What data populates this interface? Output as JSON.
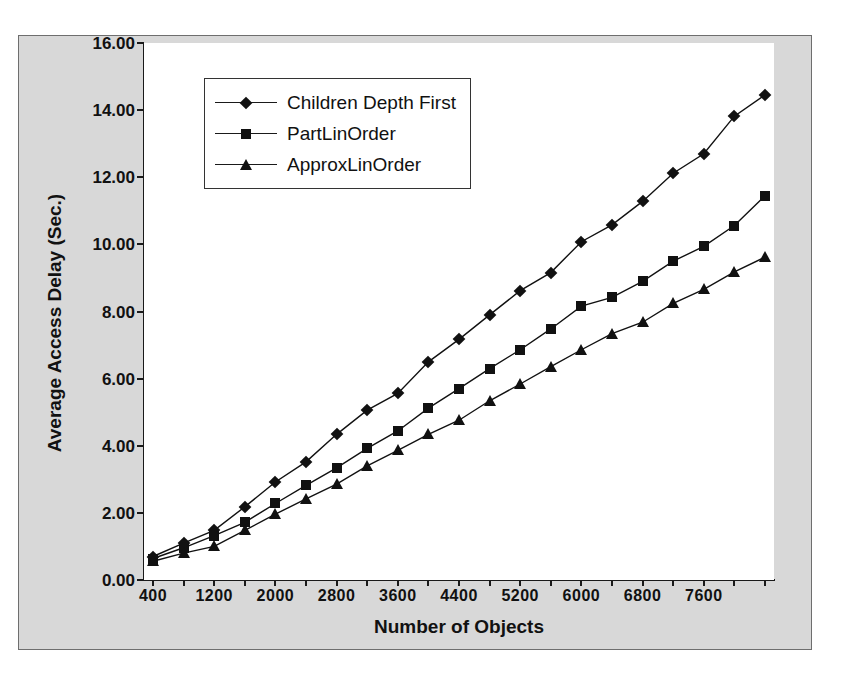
{
  "chart_data": {
    "type": "line",
    "title": "",
    "xlabel": "Number of Objects",
    "ylabel": "Average Access Delay (Sec.)",
    "xlim": [
      400,
      8400
    ],
    "ylim": [
      0,
      16
    ],
    "ytick_step": 2.0,
    "xtick_step": 800,
    "grid": false,
    "legend_position": "upper-left-inside",
    "ytick_labels": [
      "0.00",
      "2.00",
      "4.00",
      "6.00",
      "8.00",
      "10.00",
      "12.00",
      "14.00",
      "16.00"
    ],
    "ytick_values": [
      0,
      2,
      4,
      6,
      8,
      10,
      12,
      14,
      16
    ],
    "xtick_labels": [
      "400",
      "1200",
      "2000",
      "2800",
      "3600",
      "4400",
      "5200",
      "6000",
      "6800",
      "7600"
    ],
    "xtick_values": [
      400,
      1200,
      2000,
      2800,
      3600,
      4400,
      5200,
      6000,
      6800,
      7600
    ],
    "x": [
      400,
      800,
      1200,
      1600,
      2000,
      2400,
      2800,
      3200,
      3600,
      4000,
      4400,
      4800,
      5200,
      5600,
      6000,
      6400,
      6800,
      7200,
      7600,
      8000,
      8400
    ],
    "series": [
      {
        "name": "Children Depth First",
        "marker": "diamond",
        "values": [
          0.7,
          1.1,
          1.48,
          2.18,
          2.92,
          3.52,
          4.34,
          5.06,
          5.56,
          6.5,
          7.17,
          7.9,
          8.62,
          9.16,
          10.08,
          10.58,
          11.28,
          12.12,
          12.7,
          13.82,
          14.45
        ]
      },
      {
        "name": "PartLinOrder",
        "marker": "square",
        "values": [
          0.64,
          0.96,
          1.32,
          1.72,
          2.28,
          2.82,
          3.34,
          3.92,
          4.44,
          5.12,
          5.7,
          6.3,
          6.86,
          7.48,
          8.16,
          8.42,
          8.9,
          9.5,
          9.94,
          10.56,
          11.45
        ]
      },
      {
        "name": "ApproxLinOrder",
        "marker": "triangle",
        "values": [
          0.56,
          0.8,
          1.0,
          1.48,
          1.96,
          2.42,
          2.86,
          3.4,
          3.86,
          4.34,
          4.76,
          5.34,
          5.84,
          6.36,
          6.86,
          7.34,
          7.68,
          8.24,
          8.66,
          9.18,
          9.62
        ]
      }
    ]
  },
  "legend": {
    "items": [
      {
        "label": "Children Depth First",
        "marker": "diamond"
      },
      {
        "label": "PartLinOrder",
        "marker": "square"
      },
      {
        "label": "ApproxLinOrder",
        "marker": "triangle"
      }
    ]
  },
  "colors": {
    "series": "#111111",
    "plot_background": "#ffffff",
    "frame_background": "#d8d8d8",
    "axis": "#1a1a1a"
  }
}
